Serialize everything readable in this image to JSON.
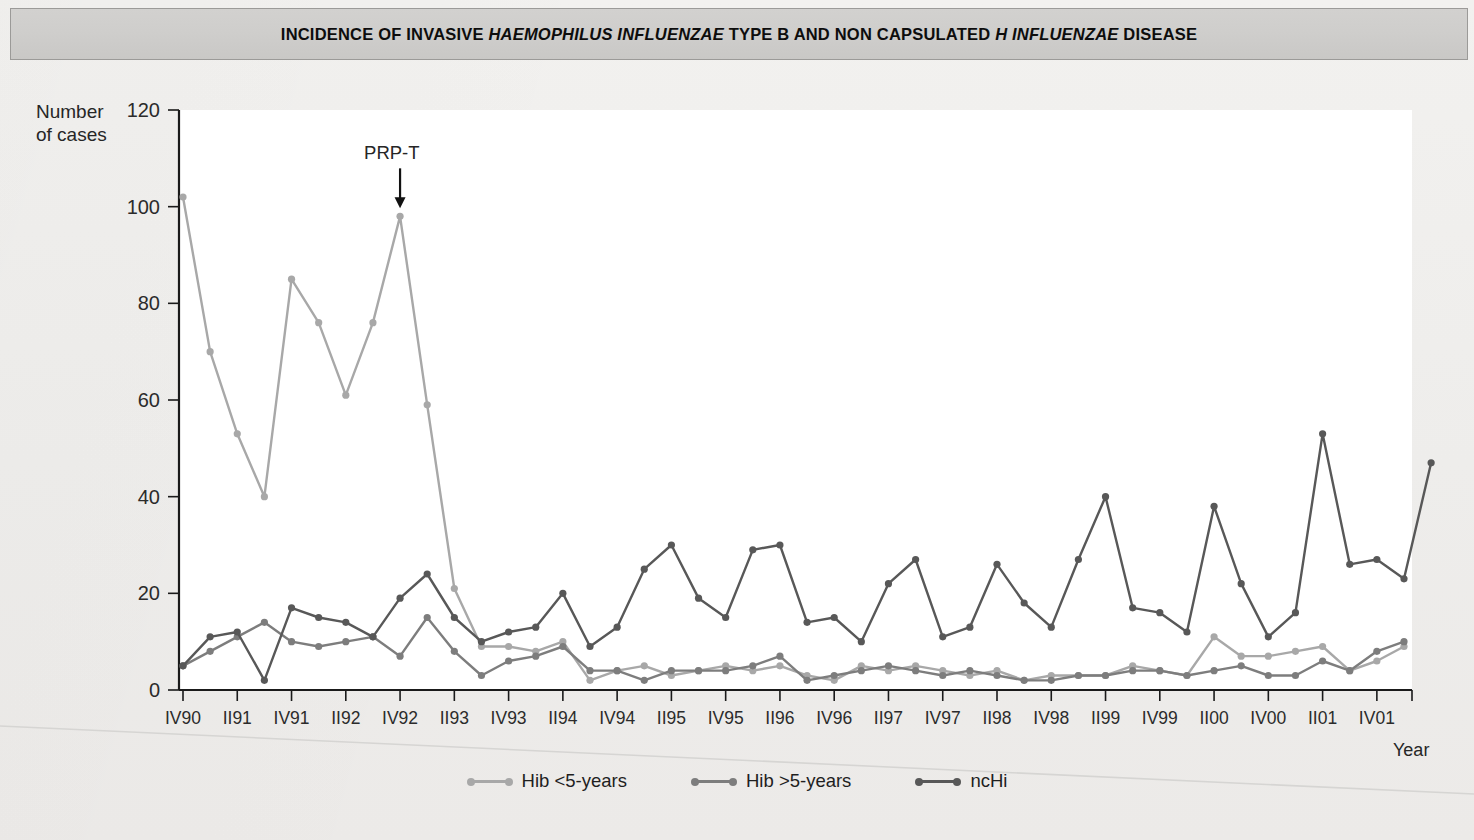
{
  "title": {
    "prefix": "INCIDENCE OF INVASIVE ",
    "italic1": "HAEMOPHILUS INFLUENZAE",
    "middle": " TYPE B AND NON CAPSULATED ",
    "italic2": "H INFLUENZAE",
    "suffix": " DISEASE",
    "full": "INCIDENCE OF INVASIVE HAEMOPHILUS INFLUENZAE TYPE B AND NON CAPSULATED H INFLUENZAE DISEASE"
  },
  "axis": {
    "y_title_line1": "Number",
    "y_title_line2": "of cases",
    "x_title": "Year"
  },
  "annotation": {
    "prpt_label": "PRP-T"
  },
  "legend": {
    "items": [
      {
        "label": "Hib <5-years",
        "color": "#a8a8a8"
      },
      {
        "label": "Hib >5-years",
        "color": "#7d7d7d"
      },
      {
        "label": "ncHi",
        "color": "#585858"
      }
    ]
  },
  "chart_data": {
    "type": "line",
    "title": "INCIDENCE OF INVASIVE HAEMOPHILUS INFLUENZAE TYPE B AND NON CAPSULATED H INFLUENZAE DISEASE",
    "xlabel": "Year",
    "ylabel": "Number of cases",
    "ylim": [
      0,
      120
    ],
    "yticks": [
      0,
      20,
      40,
      60,
      80,
      100,
      120
    ],
    "grid": false,
    "legend_position": "bottom",
    "x_tick_labels": [
      "IV90",
      "II91",
      "IV91",
      "II92",
      "IV92",
      "II93",
      "IV93",
      "II94",
      "IV94",
      "II95",
      "IV95",
      "II96",
      "IV96",
      "II97",
      "IV97",
      "II98",
      "IV98",
      "II99",
      "IV99",
      "II00",
      "IV00",
      "II01",
      "IV01"
    ],
    "x_quarters": [
      "IV90",
      "I91",
      "II91",
      "III91",
      "IV91",
      "I92",
      "II92",
      "III92",
      "IV92",
      "I93",
      "II93",
      "III93",
      "IV93",
      "I94",
      "II94",
      "III94",
      "IV94",
      "I95",
      "II95",
      "III95",
      "IV95",
      "I96",
      "II96",
      "III96",
      "IV96",
      "I97",
      "II97",
      "III97",
      "IV97",
      "I98",
      "II98",
      "III98",
      "IV98",
      "I99",
      "II99",
      "III99",
      "IV99",
      "I00",
      "II00",
      "III00",
      "IV00",
      "I01",
      "II01",
      "III01",
      "IV01",
      "I02"
    ],
    "annotations": [
      {
        "text": "PRP-T",
        "x_index": 8,
        "y": 98,
        "note": "arrow marking introduction of PRP-T vaccine"
      }
    ],
    "series": [
      {
        "name": "Hib <5-years",
        "color": "#a8a8a8",
        "values": [
          102,
          70,
          53,
          40,
          85,
          76,
          61,
          76,
          98,
          59,
          21,
          9,
          9,
          8,
          10,
          2,
          4,
          5,
          3,
          4,
          5,
          4,
          5,
          3,
          2,
          5,
          4,
          5,
          4,
          3,
          4,
          2,
          3,
          3,
          3,
          5,
          4,
          3,
          11,
          7,
          7,
          8,
          9,
          4,
          6,
          9
        ]
      },
      {
        "name": "Hib >5-years",
        "color": "#7d7d7d",
        "values": [
          5,
          8,
          11,
          14,
          10,
          9,
          10,
          11,
          7,
          15,
          8,
          3,
          6,
          7,
          9,
          4,
          4,
          2,
          4,
          4,
          4,
          5,
          7,
          2,
          3,
          4,
          5,
          4,
          3,
          4,
          3,
          2,
          2,
          3,
          3,
          4,
          4,
          3,
          4,
          5,
          3,
          3,
          6,
          4,
          8,
          10
        ]
      },
      {
        "name": "ncHi",
        "color": "#585858",
        "values": [
          5,
          11,
          12,
          2,
          17,
          15,
          14,
          11,
          19,
          24,
          15,
          10,
          12,
          13,
          20,
          9,
          13,
          25,
          30,
          19,
          15,
          29,
          30,
          14,
          15,
          10,
          22,
          27,
          11,
          13,
          26,
          18,
          13,
          27,
          40,
          17,
          16,
          12,
          38,
          22,
          11,
          16,
          53,
          26,
          27,
          23,
          47
        ]
      }
    ]
  },
  "colors": {
    "title_bar_bg": "#cfcecc",
    "page_bg": "#efeeec",
    "plot_bg": "#ffffff",
    "axis": "#1a1a1a"
  }
}
